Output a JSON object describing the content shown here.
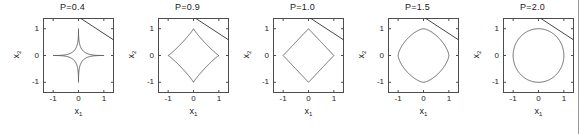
{
  "figure": {
    "background": "#ffffff",
    "axis_color": "#4d4d4d",
    "curve_color": "#555555",
    "line_color": "#333333",
    "divider_color": "#9a9a9a",
    "panel_count": 5,
    "panel_pitch_px": 115,
    "panel_first_left_px": 15
  },
  "axis_common": {
    "xlabel": "x",
    "xlabel_sub": "1",
    "ylabel": "x",
    "ylabel_sub": "2",
    "xticks": [
      "-1",
      "0",
      "1"
    ],
    "yticks": [
      "1",
      "0",
      "-1"
    ],
    "xtick_values": [
      -1,
      0,
      1
    ],
    "ytick_values": [
      1,
      0,
      -1
    ],
    "xlim": [
      -1.4,
      1.4
    ],
    "ylim": [
      -1.4,
      1.4
    ],
    "grid": "off",
    "box": "on"
  },
  "chart_data": {
    "type": "line",
    "title": "",
    "xlabel": "x1",
    "ylabel": "x2",
    "xlim": [
      -1.4,
      1.4
    ],
    "ylim": [
      -1.4,
      1.4
    ],
    "grid": false,
    "legend": "none",
    "panels": [
      {
        "index": 0,
        "title": "P=0.4",
        "p": 0.4,
        "curve": "lp_unit_ball",
        "curve_equation": "|x1|^0.4 + |x2|^0.4 = 1",
        "shape": "concave astroid (strongly star-shaped, cusps at axis intercepts)",
        "intercepts": [
          [
            -1,
            0
          ],
          [
            1,
            0
          ],
          [
            0,
            -1
          ],
          [
            0,
            1
          ]
        ],
        "line": {
          "slope": -0.62,
          "intercept": 1.44,
          "label": ""
        }
      },
      {
        "index": 1,
        "title": "P=0.9",
        "p": 0.9,
        "curve": "lp_unit_ball",
        "curve_equation": "|x1|^0.9 + |x2|^0.9 = 1",
        "shape": "slightly concave diamond",
        "intercepts": [
          [
            -1,
            0
          ],
          [
            1,
            0
          ],
          [
            0,
            -1
          ],
          [
            0,
            1
          ]
        ],
        "line": {
          "slope": -0.62,
          "intercept": 1.44,
          "label": ""
        }
      },
      {
        "index": 2,
        "title": "P=1.0",
        "p": 1.0,
        "curve": "lp_unit_ball",
        "curve_equation": "|x1| + |x2| = 1",
        "shape": "diamond (L1 ball)",
        "intercepts": [
          [
            -1,
            0
          ],
          [
            1,
            0
          ],
          [
            0,
            -1
          ],
          [
            0,
            1
          ]
        ],
        "line": {
          "slope": -0.62,
          "intercept": 1.44,
          "label": ""
        }
      },
      {
        "index": 3,
        "title": "P=1.5",
        "p": 1.5,
        "curve": "lp_unit_ball",
        "curve_equation": "|x1|^1.5 + |x2|^1.5 = 1",
        "shape": "rounded superellipse",
        "intercepts": [
          [
            -1,
            0
          ],
          [
            1,
            0
          ],
          [
            0,
            -1
          ],
          [
            0,
            1
          ]
        ],
        "line": {
          "slope": -0.62,
          "intercept": 1.44,
          "label": ""
        }
      },
      {
        "index": 4,
        "title": "P=2.0",
        "p": 2.0,
        "curve": "lp_unit_ball",
        "curve_equation": "x1^2 + x2^2 = 1",
        "shape": "circle (L2 ball)",
        "intercepts": [
          [
            -1,
            0
          ],
          [
            1,
            0
          ],
          [
            0,
            -1
          ],
          [
            0,
            1
          ]
        ],
        "line": {
          "slope": -0.62,
          "intercept": 1.44,
          "label": ""
        }
      }
    ]
  }
}
